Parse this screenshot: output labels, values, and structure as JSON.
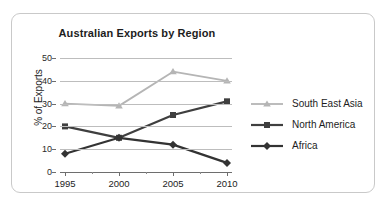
{
  "chart_data": {
    "type": "line",
    "title": "Australian Exports by Region",
    "xlabel": "",
    "ylabel": "% of Exports",
    "categories": [
      "1995",
      "2000",
      "2005",
      "2010"
    ],
    "x": [
      1995,
      2000,
      2005,
      2010
    ],
    "ylim": [
      0,
      50
    ],
    "yticks": [
      0,
      10,
      20,
      30,
      40,
      50
    ],
    "grid": true,
    "legend_position": "right",
    "series": [
      {
        "name": "South East Asia",
        "values": [
          30,
          29,
          44,
          40
        ],
        "color": "#b5b5b5",
        "marker": "triangle"
      },
      {
        "name": "North America",
        "values": [
          20,
          15,
          25,
          31
        ],
        "color": "#3f3f3f",
        "marker": "square"
      },
      {
        "name": "Africa",
        "values": [
          8,
          15,
          12,
          4
        ],
        "color": "#333333",
        "marker": "diamond"
      }
    ]
  },
  "ytick_labels": [
    "50",
    "40",
    "30",
    "20",
    "10",
    "0"
  ],
  "xtick_labels": [
    "1995",
    "2000",
    "2005",
    "2010"
  ],
  "legend": {
    "items": [
      {
        "label": "South East Asia"
      },
      {
        "label": "North America"
      },
      {
        "label": "Africa"
      }
    ]
  },
  "colors": {
    "card_border": "#c9c9c9",
    "gridline": "#bdbdbd",
    "axis": "#6e6e6e",
    "text": "#1d1d1d",
    "south_east_asia": "#b5b5b5",
    "north_america": "#3f3f3f",
    "africa": "#333333"
  }
}
